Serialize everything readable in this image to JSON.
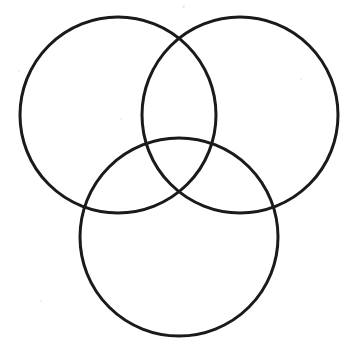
{
  "document": {
    "title": "Three-Circle Venn Diagram",
    "background_color": "#ffffff",
    "width": 356,
    "height": 343
  },
  "diagram": {
    "type": "venn",
    "set_count": 3,
    "stroke_color": "#1a1a1a",
    "stroke_width": 3,
    "fill": "none",
    "labels_present": false,
    "region_counts_present": false,
    "circles": [
      {
        "id": "left",
        "name": "top-left-circle",
        "cx": 118,
        "cy": 115,
        "r": 98,
        "label": ""
      },
      {
        "id": "right",
        "name": "top-right-circle",
        "cx": 240,
        "cy": 115,
        "r": 98,
        "label": ""
      },
      {
        "id": "bottom",
        "name": "bottom-circle",
        "cx": 179,
        "cy": 237,
        "r": 99,
        "label": ""
      }
    ],
    "intersections": [
      {
        "name": "left-right-upper",
        "x": 180,
        "y": 45
      },
      {
        "name": "left-right-lower",
        "x": 180,
        "y": 192
      },
      {
        "name": "left-bottom-upper",
        "x": 85,
        "y": 212
      },
      {
        "name": "left-bottom-lower",
        "x": 180,
        "y": 192
      },
      {
        "name": "right-bottom-upper",
        "x": 275,
        "y": 222
      },
      {
        "name": "center-triple",
        "x": 180,
        "y": 192
      }
    ],
    "specks": [
      {
        "x": 182,
        "y": 5,
        "size": 3
      },
      {
        "x": 18,
        "y": 70,
        "size": 2
      },
      {
        "x": 300,
        "y": 78,
        "size": 2
      },
      {
        "x": 120,
        "y": 118,
        "size": 2
      },
      {
        "x": 40,
        "y": 300,
        "size": 2
      }
    ]
  }
}
